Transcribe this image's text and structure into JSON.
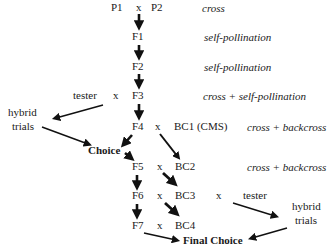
{
  "diagram": {
    "nodes": {
      "p1": "P1",
      "p2": "P2",
      "f1": "F1",
      "f2": "F2",
      "f3": "F3",
      "f4": "F4",
      "f5": "F5",
      "f6": "F6",
      "f7": "F7",
      "bc1": "BC1 (CMS)",
      "bc2": "BC2",
      "bc3": "BC3",
      "bc4": "BC4",
      "tester_left": "tester",
      "tester_right": "tester",
      "hybrid_left_1": "hybrid",
      "hybrid_left_2": "trials",
      "hybrid_right_1": "hybrid",
      "hybrid_right_2": "trials",
      "choice": "Choice",
      "final_choice": "Final Choice"
    },
    "cross_symbol": "x",
    "annotations": [
      {
        "row": "P",
        "text": "cross"
      },
      {
        "row": "F1",
        "text": "self-pollination"
      },
      {
        "row": "F2",
        "text": "self-pollination"
      },
      {
        "row": "F3",
        "text": "cross + self-pollination"
      },
      {
        "row": "F4",
        "text": "cross + backcross"
      },
      {
        "row": "F5",
        "text": "cross + backcross"
      }
    ],
    "edges": [
      {
        "from": "P1 x P2",
        "to": "F1"
      },
      {
        "from": "F1",
        "to": "F2"
      },
      {
        "from": "F2",
        "to": "F3"
      },
      {
        "from": "F3",
        "to": "F4"
      },
      {
        "from": "tester x F3",
        "to": "hybrid trials (left)"
      },
      {
        "from": "hybrid trials (left)",
        "to": "Choice"
      },
      {
        "from": "F4",
        "to": "Choice"
      },
      {
        "from": "Choice",
        "to": "F5"
      },
      {
        "from": "F4 x BC1 (CMS)",
        "to": "BC2"
      },
      {
        "from": "F5 x BC2",
        "to": "BC3"
      },
      {
        "from": "F5",
        "to": "F6"
      },
      {
        "from": "F6 x BC3",
        "to": "BC4"
      },
      {
        "from": "F6",
        "to": "F7"
      },
      {
        "from": "BC3 x tester",
        "to": "hybrid trials (right)"
      },
      {
        "from": "hybrid trials (right)",
        "to": "Final Choice"
      },
      {
        "from": "F7",
        "to": "Final Choice"
      }
    ],
    "colors": {
      "text": "#1a1a1a",
      "arrow": "#111111",
      "background": "#ffffff"
    }
  }
}
